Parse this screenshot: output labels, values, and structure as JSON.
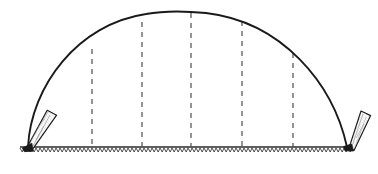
{
  "figure": {
    "canvas": {
      "width": 378,
      "height": 174
    },
    "background_color": "#ffffff",
    "ink_color": "#1a1a1a"
  },
  "arc": {
    "name": "arched-member",
    "stroke_color": "#1a1a1a",
    "stroke_width": 1.9,
    "left_base": {
      "x": 28,
      "y": 147
    },
    "right_base": {
      "x": 347,
      "y": 147
    },
    "apex": {
      "x": 190,
      "y": 12
    },
    "span": 319,
    "rise": 135,
    "path": "M 28 147 C 31 86, 78 24, 146 14 C 162 11, 186 11, 206 13 C 282 22, 333 83, 347 147"
  },
  "dashed_verticals": {
    "name": "dashed-reference-lines",
    "stroke_color": "#4d4d4d",
    "stroke_width": 1.2,
    "dash_pattern": "5 5",
    "ground_y": 147,
    "lines": [
      {
        "id": "line-1",
        "x": 92,
        "top_y": 49
      },
      {
        "id": "line-2",
        "x": 142,
        "top_y": 22
      },
      {
        "id": "line-3",
        "x": 191,
        "top_y": 13
      },
      {
        "id": "line-4",
        "x": 242,
        "top_y": 21
      },
      {
        "id": "line-5",
        "x": 293,
        "top_y": 53
      }
    ]
  },
  "ground": {
    "name": "ground-line",
    "stroke_color": "#2a2a2a",
    "stroke_width": 1.3,
    "y": 147,
    "x_start": 20,
    "x_end": 356,
    "hatch": {
      "stroke_color": "#3a3a3a",
      "stroke_width": 0.9,
      "tooth_width": 4,
      "tooth_depth": 4,
      "description": "zigzag hatching below the ground line"
    }
  },
  "stakes": [
    {
      "id": "left-stake",
      "name": "left-ground-stake",
      "tip": {
        "x": 28,
        "y": 147
      },
      "head": {
        "x": 52,
        "y": 115
      },
      "angle_deg": -37,
      "length": 40,
      "head_width": 10,
      "tip_width": 3,
      "fill_color": "#ffffff",
      "stroke_color": "#1a1a1a",
      "stroke_width": 1.2,
      "stipple_color": "#6a6a6a",
      "tip_fill": "#1a1a1a"
    },
    {
      "id": "right-stake",
      "name": "right-ground-stake",
      "tip": {
        "x": 347,
        "y": 147
      },
      "head": {
        "x": 366,
        "y": 116
      },
      "angle_deg": 32,
      "length": 37,
      "head_width": 10,
      "tip_width": 3,
      "fill_color": "#ffffff",
      "stroke_color": "#1a1a1a",
      "stroke_width": 1.2,
      "stipple_color": "#6a6a6a",
      "tip_fill": "#1a1a1a"
    }
  ]
}
